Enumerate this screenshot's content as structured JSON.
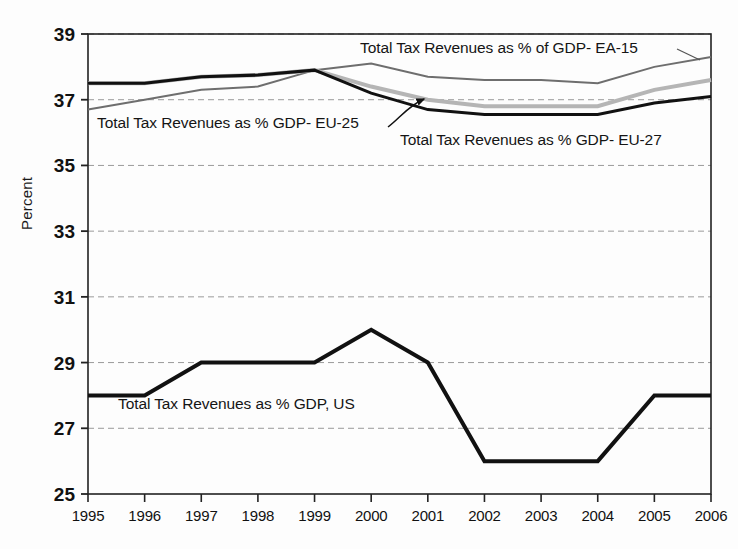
{
  "chart_data": {
    "type": "line",
    "title": "",
    "xlabel": "",
    "ylabel": "Percent",
    "categories": [
      "1995",
      "1996",
      "1997",
      "1998",
      "1999",
      "2000",
      "2001",
      "2002",
      "2003",
      "2004",
      "2005",
      "2006"
    ],
    "x": [
      1995,
      1996,
      1997,
      1998,
      1999,
      2000,
      2001,
      2002,
      2003,
      2004,
      2005,
      2006
    ],
    "ylim": [
      25,
      39
    ],
    "xlim": [
      1995,
      2006
    ],
    "yticks": [
      25,
      27,
      29,
      31,
      33,
      35,
      37,
      39
    ],
    "ytick_labels": [
      "25",
      "27",
      "29",
      "31",
      "33",
      "35",
      "37",
      "39"
    ],
    "grid": "horizontal-dashed",
    "legend_position": "inline-annotations",
    "series": [
      {
        "name": "Total Tax Revenues as % of GDP- EA-15",
        "color": "#6e6e6e",
        "width": 2.0,
        "values": [
          36.7,
          37.0,
          37.3,
          37.4,
          37.9,
          38.1,
          37.7,
          37.6,
          37.6,
          37.5,
          38.0,
          38.3
        ]
      },
      {
        "name": "Total Tax Revenues as % GDP- EU-25",
        "color": "#b5b5b5",
        "width": 4.0,
        "values": [
          37.5,
          37.5,
          37.7,
          37.75,
          37.9,
          37.4,
          37.0,
          36.8,
          36.8,
          36.8,
          37.3,
          37.6
        ]
      },
      {
        "name": "Total Tax Revenues as % GDP- EU-27",
        "color": "#111111",
        "width": 3.0,
        "values": [
          37.5,
          37.5,
          37.7,
          37.75,
          37.9,
          37.2,
          36.7,
          36.55,
          36.55,
          36.55,
          36.9,
          37.1
        ]
      },
      {
        "name": "Total Tax Revenues as % GDP, US",
        "color": "#111111",
        "width": 4.0,
        "values": [
          28,
          28,
          29,
          29,
          29,
          30,
          29,
          26,
          26,
          26,
          28,
          28
        ]
      }
    ],
    "annotations": [
      {
        "id": "ea15-label",
        "text": "Total Tax Revenues as % of GDP- EA-15",
        "x": 360,
        "y": 53
      },
      {
        "id": "eu25-label",
        "text": "Total Tax Revenues as % GDP- EU-25",
        "x": 97,
        "y": 128
      },
      {
        "id": "eu27-label",
        "text": "Total Tax Revenues as % GDP- EU-27",
        "x": 400,
        "y": 145
      },
      {
        "id": "us-label",
        "text": "Total Tax Revenues as % GDP, US",
        "x": 118,
        "y": 409
      }
    ]
  },
  "axis": {
    "y_title": "Percent"
  }
}
